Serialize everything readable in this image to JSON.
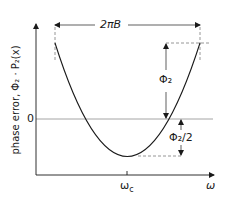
{
  "diagram": {
    "y_axis_label": "phase error, Φ₂ · P₂(x)",
    "x_axis_label": "ω",
    "zero_label": "0",
    "center_tick_label": "ωc",
    "center_tick_main": "ω",
    "center_tick_sub": "c",
    "bandwidth_label": "2πB",
    "peak_label": "Φ₂",
    "half_label": "Φ₂/2",
    "colors": {
      "axis": "#1a1a1a",
      "zero_line": "#9a9a9a",
      "curve": "#1a1a1a",
      "dashed": "#8a8a8a"
    }
  }
}
